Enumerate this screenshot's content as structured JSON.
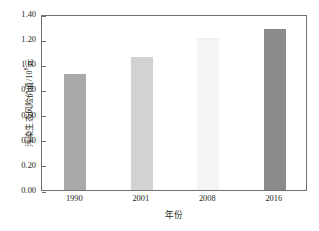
{
  "chart_data": {
    "type": "bar",
    "title": "",
    "subtitle": "",
    "xlabel": "年份",
    "ylabel": "污染生态风险价值/10⁸元",
    "ylabel_main": "污染生态风险价值/10",
    "ylabel_exponent": "8",
    "ylabel_unit": "元",
    "categories": [
      "1990",
      "2001",
      "2008",
      "2016"
    ],
    "values": [
      0.91,
      1.05,
      1.2,
      1.27
    ],
    "series": [
      {
        "name": "污染生态风险价值",
        "values": [
          0.91,
          1.05,
          1.2,
          1.27
        ]
      }
    ],
    "bar_colors": [
      "#a9a9a9",
      "#d2d2d2",
      "#f4f4f4",
      "#8b8b8b"
    ],
    "bar_edge_colors": [
      "#a9a9a9",
      "#cfcfcf",
      "#ededed",
      "#8b8b8b"
    ],
    "ylim": [
      0.0,
      1.4
    ],
    "yticks": [
      0.0,
      0.2,
      0.4,
      0.6,
      0.8,
      1.0,
      1.2,
      1.4
    ],
    "ytick_labels": [
      "0.00",
      "0.20",
      "0.40",
      "0.60",
      "0.80",
      "1.00",
      "1.20",
      "1.40"
    ],
    "grid": false,
    "legend": null,
    "legend_position": "none",
    "axis_color": "#6f6f6f",
    "text_color": "#231f20",
    "background_color": "#ffffff",
    "annotations": []
  }
}
